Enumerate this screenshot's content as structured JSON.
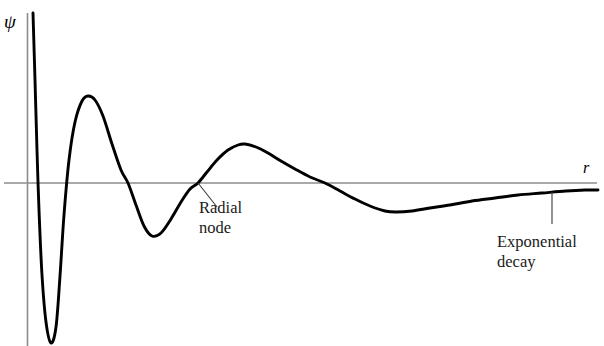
{
  "figure": {
    "background_color": "#ffffff",
    "width": 604,
    "height": 346
  },
  "axes": {
    "y_axis_label": "ψ",
    "x_axis_label": "r",
    "axis_color": "#808080",
    "curve_color": "#000000",
    "x_axis_y_pixel": 183,
    "y_axis_x_pixel": 27
  },
  "annotations": {
    "radial_node": {
      "line1": "Radial",
      "line2": "node",
      "leader_from_x": 198,
      "leader_from_y": 183,
      "leader_to_x": 217,
      "leader_to_y": 207
    },
    "exponential_decay": {
      "line1": "Exponential",
      "line2": "decay",
      "leader_from_x": 552,
      "leader_from_y": 192,
      "leader_to_x": 552,
      "leader_to_y": 224
    }
  },
  "chart_data": {
    "type": "line",
    "title": "",
    "xlabel": "r",
    "ylabel": "ψ",
    "grid": false,
    "legend": false,
    "axis_line_y": 0,
    "xlim": [
      0,
      604
    ],
    "ylim": [
      -170,
      175
    ],
    "zero_crossings_px_x": [
      38,
      62,
      128,
      197,
      325
    ],
    "extrema": [
      {
        "type": "deep-minimum",
        "x_px": 51,
        "y_px": 344,
        "note": "cusp below visible frame"
      },
      {
        "type": "maximum",
        "x_px": 88,
        "y_px": 96
      },
      {
        "type": "minimum",
        "x_px": 152,
        "y_px": 236
      },
      {
        "type": "maximum",
        "x_px": 245,
        "y_px": 144
      },
      {
        "type": "minimum",
        "x_px": 396,
        "y_px": 212
      }
    ],
    "points_px": [
      [
        33,
        13
      ],
      [
        35,
        80
      ],
      [
        37,
        150
      ],
      [
        39,
        210
      ],
      [
        42,
        275
      ],
      [
        46,
        322
      ],
      [
        51,
        343
      ],
      [
        56,
        327
      ],
      [
        60,
        276
      ],
      [
        64,
        215
      ],
      [
        69,
        160
      ],
      [
        75,
        122
      ],
      [
        82,
        101
      ],
      [
        88,
        96
      ],
      [
        95,
        100
      ],
      [
        103,
        116
      ],
      [
        112,
        144
      ],
      [
        121,
        170
      ],
      [
        128,
        183
      ],
      [
        136,
        205
      ],
      [
        144,
        226
      ],
      [
        152,
        236
      ],
      [
        161,
        233
      ],
      [
        171,
        219
      ],
      [
        181,
        202
      ],
      [
        190,
        189
      ],
      [
        198,
        183
      ],
      [
        207,
        172
      ],
      [
        217,
        160
      ],
      [
        228,
        150
      ],
      [
        238,
        145
      ],
      [
        245,
        144
      ],
      [
        256,
        147
      ],
      [
        268,
        153
      ],
      [
        281,
        161
      ],
      [
        295,
        169
      ],
      [
        310,
        177
      ],
      [
        325,
        183
      ],
      [
        340,
        191
      ],
      [
        355,
        199
      ],
      [
        370,
        206
      ],
      [
        385,
        211
      ],
      [
        396,
        212
      ],
      [
        412,
        211
      ],
      [
        430,
        208
      ],
      [
        450,
        205
      ],
      [
        472,
        201
      ],
      [
        495,
        198
      ],
      [
        518,
        195
      ],
      [
        542,
        193
      ],
      [
        566,
        191
      ],
      [
        585,
        190
      ],
      [
        598,
        190
      ]
    ]
  }
}
